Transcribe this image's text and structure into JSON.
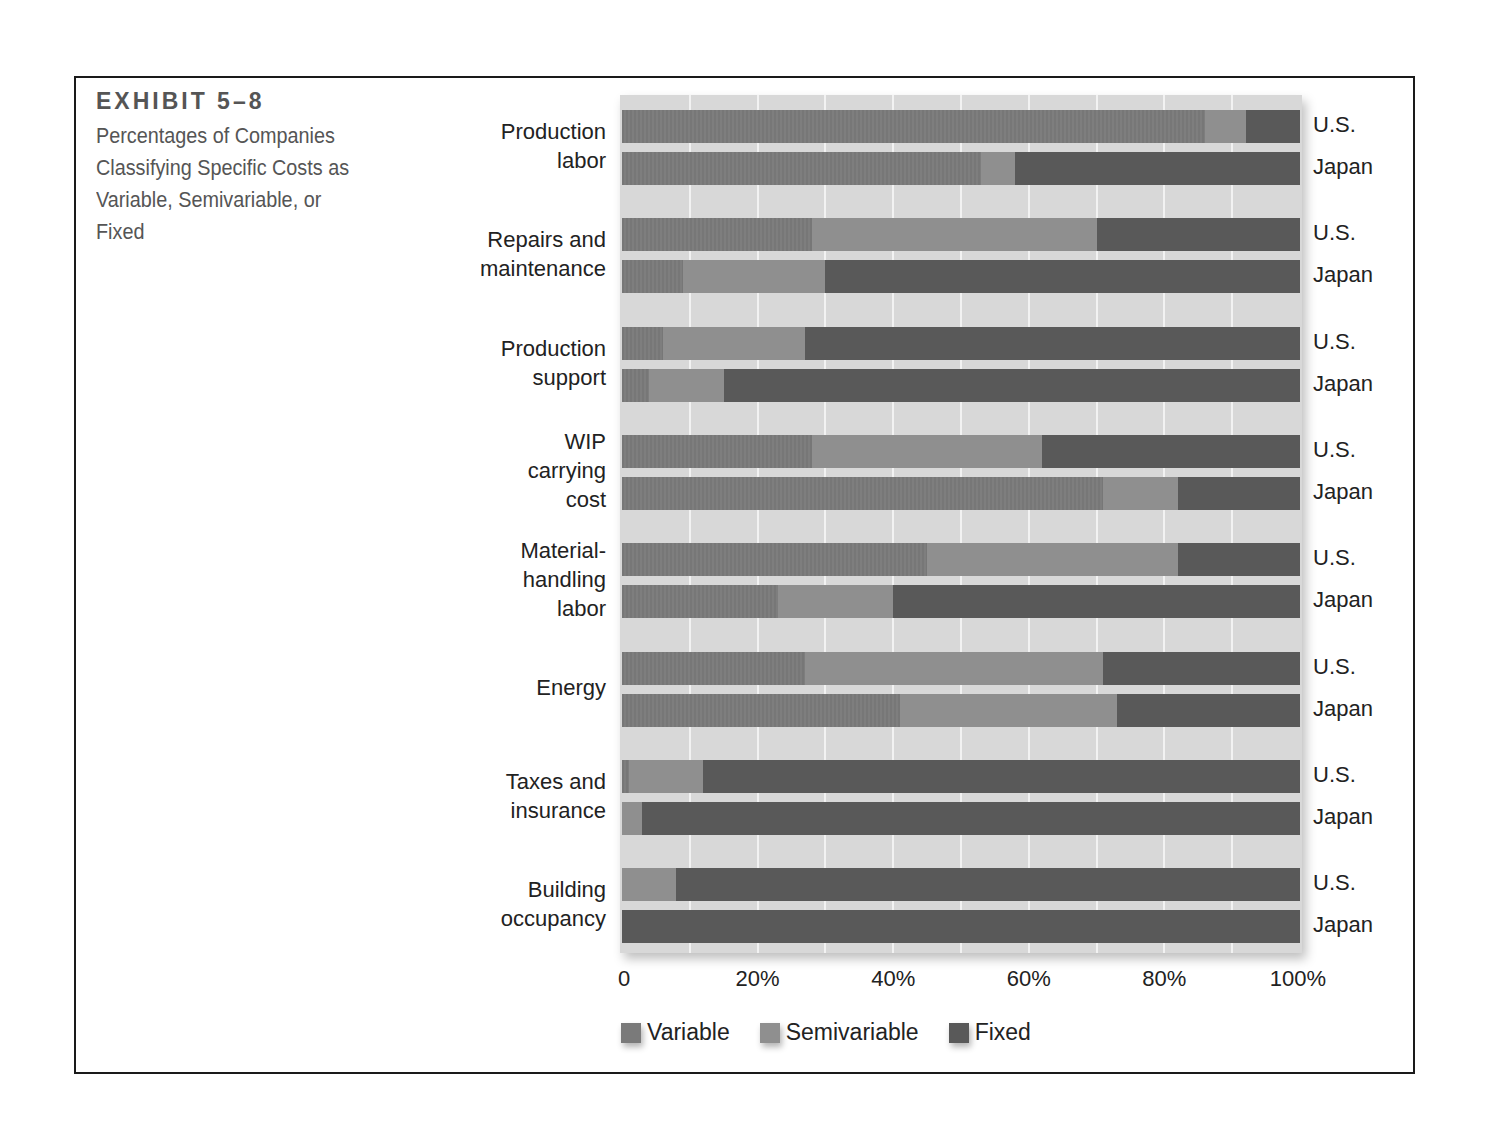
{
  "exhibit": {
    "label": "EXHIBIT 5–8",
    "subtitle": "Percentages of Companies Classifying Specific Costs as Variable, Semivariable, or Fixed"
  },
  "colors": {
    "variable": "#7a7a7a",
    "semivariable": "#8f8f8f",
    "fixed": "#595959",
    "plot_background": "#d8d8d8",
    "gridline": "#f2f2f2"
  },
  "axis": {
    "ticks": [
      "0",
      "20%",
      "40%",
      "60%",
      "80%",
      "100%"
    ]
  },
  "legend": {
    "variable": "Variable",
    "semivariable": "Semivariable",
    "fixed": "Fixed"
  },
  "countries": {
    "us": "U.S.",
    "japan": "Japan"
  },
  "chart_data": {
    "type": "bar",
    "orientation": "horizontal",
    "stacked": true,
    "xlabel": "",
    "ylabel": "",
    "xlim": [
      0,
      100
    ],
    "x_ticks": [
      "0",
      "20%",
      "40%",
      "60%",
      "80%",
      "100%"
    ],
    "grid": "vertical every 10%",
    "legend_position": "bottom",
    "legend": [
      "Variable",
      "Semivariable",
      "Fixed"
    ],
    "categories": [
      "Production labor",
      "Repairs and maintenance",
      "Production support",
      "WIP carrying cost",
      "Material-handling labor",
      "Energy",
      "Taxes and insurance",
      "Building occupancy"
    ],
    "groups": [
      "U.S.",
      "Japan"
    ],
    "rows": [
      {
        "category": "Production labor",
        "country": "U.S.",
        "variable": 86,
        "semivariable": 6,
        "fixed": 8
      },
      {
        "category": "Production labor",
        "country": "Japan",
        "variable": 53,
        "semivariable": 5,
        "fixed": 42
      },
      {
        "category": "Repairs and maintenance",
        "country": "U.S.",
        "variable": 28,
        "semivariable": 42,
        "fixed": 30
      },
      {
        "category": "Repairs and maintenance",
        "country": "Japan",
        "variable": 9,
        "semivariable": 21,
        "fixed": 70
      },
      {
        "category": "Production support",
        "country": "U.S.",
        "variable": 6,
        "semivariable": 21,
        "fixed": 73
      },
      {
        "category": "Production support",
        "country": "Japan",
        "variable": 4,
        "semivariable": 11,
        "fixed": 85
      },
      {
        "category": "WIP carrying cost",
        "country": "U.S.",
        "variable": 28,
        "semivariable": 34,
        "fixed": 38
      },
      {
        "category": "WIP carrying cost",
        "country": "Japan",
        "variable": 71,
        "semivariable": 11,
        "fixed": 18
      },
      {
        "category": "Material-handling labor",
        "country": "U.S.",
        "variable": 45,
        "semivariable": 37,
        "fixed": 18
      },
      {
        "category": "Material-handling labor",
        "country": "Japan",
        "variable": 23,
        "semivariable": 17,
        "fixed": 60
      },
      {
        "category": "Energy",
        "country": "U.S.",
        "variable": 27,
        "semivariable": 44,
        "fixed": 29
      },
      {
        "category": "Energy",
        "country": "Japan",
        "variable": 41,
        "semivariable": 32,
        "fixed": 27
      },
      {
        "category": "Taxes and insurance",
        "country": "U.S.",
        "variable": 1,
        "semivariable": 11,
        "fixed": 88
      },
      {
        "category": "Taxes and insurance",
        "country": "Japan",
        "variable": 0,
        "semivariable": 3,
        "fixed": 97
      },
      {
        "category": "Building occupancy",
        "country": "U.S.",
        "variable": 0,
        "semivariable": 8,
        "fixed": 92
      },
      {
        "category": "Building occupancy",
        "country": "Japan",
        "variable": 0,
        "semivariable": 0,
        "fixed": 100
      }
    ],
    "category_labels": [
      [
        "Production",
        "labor"
      ],
      [
        "Repairs and",
        "maintenance"
      ],
      [
        "Production",
        "support"
      ],
      [
        "WIP",
        "carrying",
        "cost"
      ],
      [
        "Material-",
        "handling",
        "labor"
      ],
      [
        "Energy"
      ],
      [
        "Taxes and",
        "insurance"
      ],
      [
        "Building",
        "occupancy"
      ]
    ]
  }
}
